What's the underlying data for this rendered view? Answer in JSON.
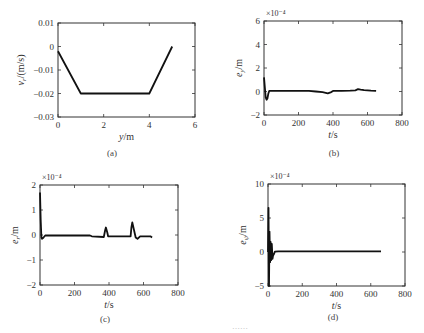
{
  "figure": {
    "caption_partial": "……"
  },
  "chart_data": [
    {
      "id": "a",
      "type": "line",
      "panel_label": "(a)",
      "title": "",
      "xlabel": "y/m",
      "ylabel": "v_r/(m/s)",
      "xlim": [
        0,
        6
      ],
      "ylim": [
        -0.03,
        0.01
      ],
      "xticks": [
        0,
        2,
        4,
        6
      ],
      "xtick_labels": [
        "0",
        "2",
        "4",
        "6"
      ],
      "yticks": [
        0.01,
        0,
        -0.01,
        -0.02,
        -0.03
      ],
      "ytick_labels": [
        "0.01",
        "0",
        "−0.01",
        "−0.02",
        "−0.03"
      ],
      "grid": false,
      "scale_note": "",
      "series": [
        {
          "name": "v_r",
          "x": [
            0,
            1,
            4,
            5
          ],
          "y": [
            -0.002,
            -0.02,
            -0.02,
            0.0
          ]
        }
      ]
    },
    {
      "id": "b",
      "type": "line",
      "panel_label": "(b)",
      "title": "",
      "xlabel": "t/s",
      "ylabel": "e_y/m",
      "xlim": [
        0,
        800
      ],
      "ylim": [
        -2,
        6
      ],
      "xticks": [
        0,
        200,
        400,
        600,
        800
      ],
      "xtick_labels": [
        "0",
        "200",
        "400",
        "600",
        "800"
      ],
      "yticks": [
        6,
        4,
        2,
        0,
        -2
      ],
      "ytick_labels": [
        "6",
        "4",
        "2",
        "0",
        "−2"
      ],
      "grid": false,
      "scale_note": "×10⁻⁴",
      "series": [
        {
          "name": "e_y",
          "x": [
            0,
            5,
            10,
            15,
            20,
            25,
            30,
            40,
            60,
            100,
            200,
            260,
            300,
            340,
            370,
            390,
            400,
            450,
            500,
            530,
            545,
            560,
            580,
            600,
            620,
            650
          ],
          "y": [
            1.2,
            0.3,
            -0.5,
            -0.7,
            -0.6,
            -0.2,
            0.05,
            0.05,
            0.05,
            0.05,
            0.05,
            0.05,
            0.0,
            -0.05,
            -0.15,
            -0.05,
            0.05,
            0.05,
            0.08,
            0.1,
            0.2,
            0.15,
            0.12,
            0.1,
            0.08,
            0.05
          ]
        }
      ]
    },
    {
      "id": "c",
      "type": "line",
      "panel_label": "(c)",
      "title": "",
      "xlabel": "t/s",
      "ylabel": "e_r/m",
      "xlim": [
        0,
        800
      ],
      "ylim": [
        -2,
        2
      ],
      "xticks": [
        0,
        200,
        400,
        600,
        800
      ],
      "xtick_labels": [
        "0",
        "200",
        "400",
        "600",
        "800"
      ],
      "yticks": [
        2,
        1,
        0,
        -1,
        -2
      ],
      "ytick_labels": [
        "2",
        "1",
        "0",
        "−1",
        "−2"
      ],
      "grid": false,
      "scale_note": "×10⁻⁴",
      "series": [
        {
          "name": "e_r",
          "x": [
            0,
            4,
            8,
            12,
            20,
            30,
            40,
            100,
            200,
            290,
            300,
            370,
            378,
            382,
            390,
            395,
            400,
            500,
            525,
            530,
            535,
            545,
            555,
            565,
            580,
            600,
            640,
            650
          ],
          "y": [
            1.7,
            0.6,
            -0.1,
            -0.15,
            -0.1,
            -0.02,
            -0.02,
            -0.02,
            -0.02,
            -0.02,
            -0.05,
            -0.08,
            0.2,
            0.3,
            0.1,
            -0.05,
            -0.05,
            -0.05,
            -0.05,
            0.3,
            0.5,
            0.2,
            -0.1,
            -0.15,
            -0.05,
            -0.05,
            -0.05,
            -0.1
          ]
        }
      ]
    },
    {
      "id": "d",
      "type": "line",
      "panel_label": "(d)",
      "title": "",
      "xlabel": "t/s",
      "ylabel": "e_ψ/m",
      "xlim": [
        0,
        800
      ],
      "ylim": [
        -5,
        10
      ],
      "xticks": [
        0,
        200,
        400,
        600,
        800
      ],
      "xtick_labels": [
        "0",
        "200",
        "400",
        "600",
        "800"
      ],
      "yticks": [
        10,
        5,
        0,
        -5
      ],
      "ytick_labels": [
        "10",
        "5",
        "0",
        "−5"
      ],
      "grid": false,
      "scale_note": "×10⁻⁴",
      "series": [
        {
          "name": "e_psi",
          "x": [
            0,
            3,
            6,
            9,
            12,
            15,
            18,
            22,
            26,
            30,
            35,
            40,
            60,
            100,
            200,
            400,
            600,
            660
          ],
          "y": [
            0,
            6.5,
            -5,
            3,
            -1.5,
            1.5,
            -1.2,
            1.2,
            -1.0,
            -0.5,
            -0.3,
            0.05,
            0.1,
            0.1,
            0.1,
            0.1,
            0.1,
            0.1
          ]
        }
      ]
    }
  ]
}
